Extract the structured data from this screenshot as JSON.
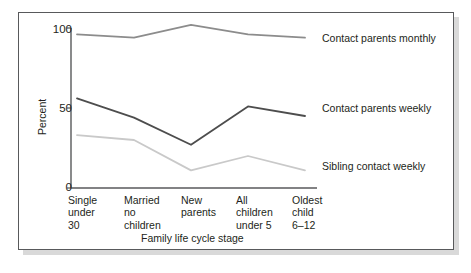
{
  "chart_data": {
    "type": "line",
    "title": "",
    "xlabel": "Family life cycle stage",
    "ylabel": "Percent",
    "categories": [
      "Single\nunder\n30",
      "Married\nno\nchildren",
      "New\nparents",
      "All\nchildren\nunder 5",
      "Oldest\nchild\n6–12"
    ],
    "ylim": [
      0,
      100
    ],
    "yticks": [
      0,
      50,
      100
    ],
    "ytick_labels": [
      "0",
      "50",
      "100"
    ],
    "grid": false,
    "legend_position": "right-inline",
    "series": [
      {
        "name": "Contact parents monthly",
        "color": "#8c8c8c",
        "values": [
          96,
          94,
          102,
          96,
          94
        ]
      },
      {
        "name": "Contact parents weekly",
        "color": "#4d4d4d",
        "values": [
          56,
          44,
          27,
          51,
          45
        ]
      },
      {
        "name": "Sibling contact weekly",
        "color": "#c9c9c9",
        "values": [
          33,
          30,
          11,
          20,
          11
        ]
      }
    ]
  },
  "axis": {
    "y_label": "Percent",
    "y_ticks": [
      "100",
      "50",
      "0"
    ],
    "x_title": "Family life cycle stage",
    "x_categories": [
      "Single\nunder\n30",
      "Married\nno\nchildren",
      "New\nparents",
      "All\nchildren\nunder 5",
      "Oldest\nchild\n6–12"
    ]
  },
  "legend": {
    "items": [
      {
        "label": "Contact parents monthly"
      },
      {
        "label": "Contact parents weekly"
      },
      {
        "label": "Sibling contact weekly"
      }
    ]
  },
  "colors": {
    "monthly": "#8c8c8c",
    "weekly": "#4d4d4d",
    "sibling": "#c9c9c9",
    "axis": "#58595b",
    "text": "#231f20",
    "frame": "#58595b",
    "shadow": "#d9d9d9"
  }
}
